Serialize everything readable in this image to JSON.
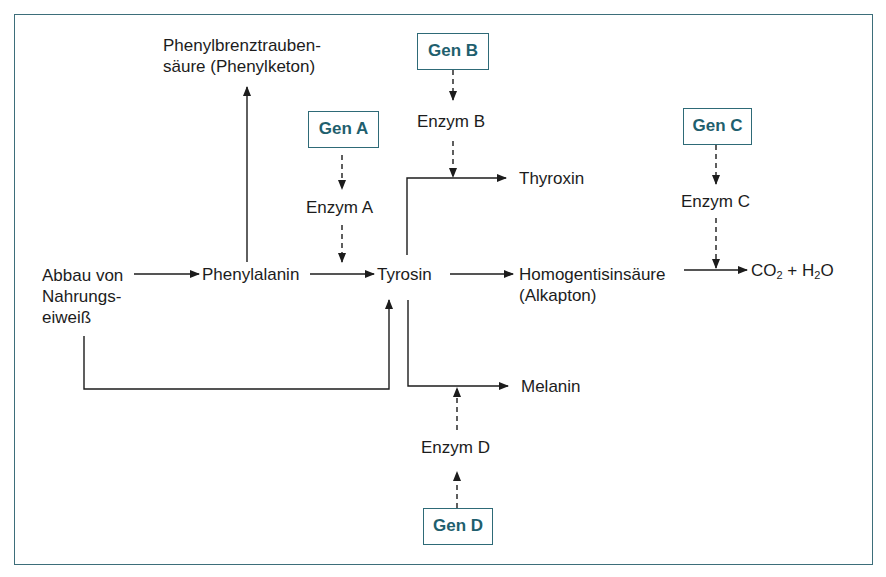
{
  "diagram": {
    "type": "metabolic-pathway",
    "border_color": "#3d6e7a",
    "gene_color": "#1f5f6e",
    "nodes": {
      "source": [
        "Abbau von",
        "Nahrungs-",
        "eiweiß"
      ],
      "phenylalanin": "Phenylalanin",
      "phenylbrenz": [
        "Phenylbrenztrauben-",
        "säure (Phenylketon)"
      ],
      "tyrosin": "Tyrosin",
      "thyroxin": "Thyroxin",
      "homogentisin": [
        "Homogentisinsäure",
        "(Alkapton)"
      ],
      "co2": "CO",
      "co2_sub": "2",
      "plus_h": " + H",
      "h2o_sub": "2",
      "o": "O",
      "melanin": "Melanin"
    },
    "genes": {
      "a": "Gen A",
      "b": "Gen B",
      "c": "Gen C",
      "d": "Gen D"
    },
    "enzymes": {
      "a": "Enzym A",
      "b": "Enzym B",
      "c": "Enzym C",
      "d": "Enzym D"
    },
    "edges": [
      {
        "from": "Abbau von Nahrungseiweiß",
        "to": "Phenylalanin",
        "style": "solid"
      },
      {
        "from": "Abbau von Nahrungseiweiß",
        "to": "Tyrosin",
        "style": "solid"
      },
      {
        "from": "Phenylalanin",
        "to": "Phenylbrenztraubensäure (Phenylketon)",
        "style": "solid"
      },
      {
        "from": "Phenylalanin",
        "to": "Tyrosin",
        "style": "solid",
        "catalyst": "Enzym A"
      },
      {
        "from": "Tyrosin",
        "to": "Thyroxin",
        "style": "solid",
        "catalyst": "Enzym B"
      },
      {
        "from": "Tyrosin",
        "to": "Homogentisinsäure (Alkapton)",
        "style": "solid"
      },
      {
        "from": "Homogentisinsäure (Alkapton)",
        "to": "CO2 + H2O",
        "style": "solid",
        "catalyst": "Enzym C"
      },
      {
        "from": "Tyrosin",
        "to": "Melanin",
        "style": "solid",
        "catalyst": "Enzym D"
      },
      {
        "from": "Gen A",
        "to": "Enzym A",
        "style": "dashed"
      },
      {
        "from": "Gen B",
        "to": "Enzym B",
        "style": "dashed"
      },
      {
        "from": "Gen C",
        "to": "Enzym C",
        "style": "dashed"
      },
      {
        "from": "Gen D",
        "to": "Enzym D",
        "style": "dashed"
      }
    ]
  }
}
